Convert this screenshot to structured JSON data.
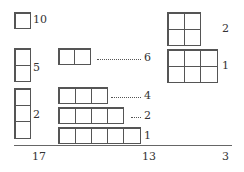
{
  "diagram": {
    "shapes": [
      {
        "id": "left-1x1",
        "cols": 1,
        "rows": 1,
        "label": "10"
      },
      {
        "id": "left-1x2",
        "cols": 1,
        "rows": 2,
        "label": "5"
      },
      {
        "id": "left-1x3",
        "cols": 1,
        "rows": 3,
        "label": "2"
      },
      {
        "id": "mid-2x1",
        "cols": 2,
        "rows": 1,
        "label": "6"
      },
      {
        "id": "mid-3x1",
        "cols": 3,
        "rows": 1,
        "label": "4"
      },
      {
        "id": "mid-4x1",
        "cols": 4,
        "rows": 1,
        "label": "2"
      },
      {
        "id": "mid-5x1",
        "cols": 5,
        "rows": 1,
        "label": "1"
      },
      {
        "id": "right-2x2",
        "cols": 2,
        "rows": 2,
        "label": "2"
      },
      {
        "id": "right-3x2",
        "cols": 3,
        "rows": 2,
        "label": "1"
      }
    ],
    "totals": {
      "left": "17",
      "middle": "13",
      "right": "3"
    }
  }
}
